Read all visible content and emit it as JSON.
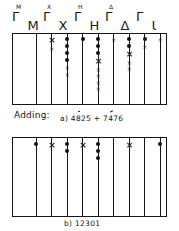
{
  "figure": {
    "caption_adding": "Adding:",
    "problem_label": "a)",
    "problem": "4825 + 7476",
    "result_label": "b)",
    "result": "12301"
  },
  "columns": [
    {
      "id": "col-50000",
      "symbol": "Γ",
      "superscript": "M",
      "value": "50000",
      "kind": "five"
    },
    {
      "id": "col-10000",
      "symbol": "M",
      "superscript": "",
      "value": "10000",
      "kind": "unit"
    },
    {
      "id": "col-5000",
      "symbol": "Γ",
      "superscript": "X",
      "value": "5000",
      "kind": "five"
    },
    {
      "id": "col-1000",
      "symbol": "X",
      "superscript": "",
      "value": "1000",
      "kind": "unit"
    },
    {
      "id": "col-500",
      "symbol": "Γ",
      "superscript": "H",
      "value": "500",
      "kind": "five"
    },
    {
      "id": "col-100",
      "symbol": "H",
      "superscript": "",
      "value": "100",
      "kind": "unit"
    },
    {
      "id": "col-50",
      "symbol": "Γ",
      "superscript": "Δ",
      "value": "50",
      "kind": "five"
    },
    {
      "id": "col-10",
      "symbol": "Δ",
      "superscript": "",
      "value": "10",
      "kind": "unit"
    },
    {
      "id": "col-5",
      "symbol": "Γ",
      "superscript": "",
      "value": "5",
      "kind": "five"
    },
    {
      "id": "col-1",
      "symbol": "Ɩ",
      "superscript": "",
      "value": "1",
      "kind": "unit"
    }
  ],
  "board_top": {
    "name": "addition-working-board",
    "cells": [
      {
        "column": "col-50000",
        "beads": 0,
        "marks": []
      },
      {
        "column": "col-10000",
        "beads": 0,
        "marks": []
      },
      {
        "column": "col-5000",
        "beads": 0,
        "marks": [
          "big",
          "small"
        ]
      },
      {
        "column": "col-1000",
        "beads": 4,
        "marks": [
          "small",
          "small"
        ]
      },
      {
        "column": "col-500",
        "beads": 1,
        "marks": []
      },
      {
        "column": "col-100",
        "beads": 3,
        "marks": [
          "big",
          "small",
          "small",
          "small",
          "small"
        ]
      },
      {
        "column": "col-50",
        "beads": 0,
        "marks": [
          "small"
        ]
      },
      {
        "column": "col-10",
        "beads": 2,
        "marks": [
          "big",
          "small",
          "small"
        ]
      },
      {
        "column": "col-5",
        "beads": 1,
        "marks": [
          "small"
        ]
      },
      {
        "column": "col-1",
        "beads": 0,
        "marks": [
          "small"
        ]
      }
    ]
  },
  "board_bottom": {
    "name": "addition-result-board",
    "cells": [
      {
        "column": "col-50000",
        "beads": 0,
        "marks": []
      },
      {
        "column": "col-10000",
        "beads": 1,
        "marks": []
      },
      {
        "column": "col-5000",
        "beads": 0,
        "marks": [
          "big"
        ]
      },
      {
        "column": "col-1000",
        "beads": 2,
        "marks": []
      },
      {
        "column": "col-500",
        "beads": 0,
        "marks": [
          "big"
        ]
      },
      {
        "column": "col-100",
        "beads": 3,
        "marks": []
      },
      {
        "column": "col-50",
        "beads": 0,
        "marks": []
      },
      {
        "column": "col-10",
        "beads": 0,
        "marks": [
          "big"
        ]
      },
      {
        "column": "col-5",
        "beads": 0,
        "marks": []
      },
      {
        "column": "col-1",
        "beads": 1,
        "marks": []
      }
    ]
  },
  "glyphs": {
    "mark_small": "×",
    "mark_big": "×"
  }
}
